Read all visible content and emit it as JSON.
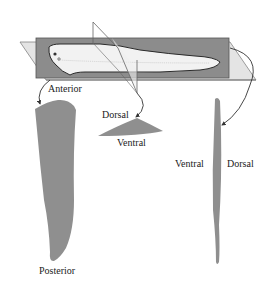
{
  "diagram": {
    "colors": {
      "plane_dark": "#8a8a8a",
      "plane_light": "#d8d8d8",
      "section_fill": "#8f8f8f",
      "fish_fill": "#f4f4f4",
      "outline": "#333333",
      "arrow": "#333333"
    },
    "labels": {
      "anterior": "Anterior",
      "posterior": "Posterior",
      "dorsal_cross": "Dorsal",
      "ventral_cross": "Ventral",
      "ventral_sagittal": "Ventral",
      "dorsal_sagittal": "Dorsal"
    }
  }
}
